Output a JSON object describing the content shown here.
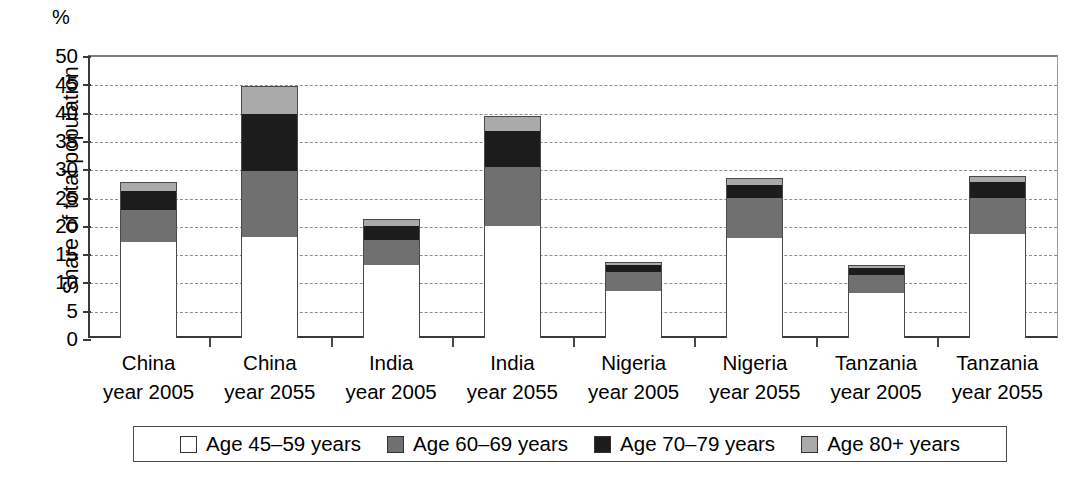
{
  "chart_data": {
    "type": "bar",
    "stacked": true,
    "title": "",
    "xlabel": "",
    "ylabel": "Share of total population",
    "yunit": "%",
    "ylim": [
      0,
      50
    ],
    "ytick_step": 5,
    "yticks": [
      "50",
      "45",
      "40",
      "35",
      "30",
      "25",
      "20",
      "15",
      "10",
      "5",
      "0"
    ],
    "grid": true,
    "legend_position": "bottom",
    "categories": [
      "China year 2005",
      "China year 2055",
      "India year 2005",
      "India year 2055",
      "Nigeria year 2005",
      "Nigeria year 2055",
      "Tanzania year 2005",
      "Tanzania year 2055"
    ],
    "category_lines": [
      {
        "l1": "China",
        "l2": "year 2005"
      },
      {
        "l1": "China",
        "l2": "year 2055"
      },
      {
        "l1": "India",
        "l2": "year 2005"
      },
      {
        "l1": "India",
        "l2": "year 2055"
      },
      {
        "l1": "Nigeria",
        "l2": "year 2005"
      },
      {
        "l1": "Nigeria",
        "l2": "year 2055"
      },
      {
        "l1": "Tanzania",
        "l2": "year 2005"
      },
      {
        "l1": "Tanzania",
        "l2": "year 2055"
      }
    ],
    "series": [
      {
        "name": "Age 45–59 years",
        "color": "#ffffff",
        "values": [
          17.0,
          18.0,
          13.0,
          19.9,
          8.5,
          17.7,
          8.1,
          18.4
        ]
      },
      {
        "name": "Age 60–69 years",
        "color": "#707070",
        "values": [
          5.8,
          11.7,
          4.4,
          10.4,
          3.4,
          7.2,
          3.2,
          6.5
        ]
      },
      {
        "name": "Age 70–79 years",
        "color": "#1c1c1c",
        "values": [
          3.4,
          10.0,
          2.6,
          6.5,
          1.2,
          2.3,
          1.2,
          2.8
        ]
      },
      {
        "name": "Age 80+ years",
        "color": "#aaaaaa",
        "values": [
          1.4,
          4.8,
          1.0,
          2.5,
          0.4,
          1.1,
          0.4,
          1.0
        ]
      }
    ],
    "totals": [
      27.6,
      44.5,
      21.0,
      39.3,
      13.5,
      28.3,
      12.9,
      28.7
    ]
  },
  "legend": {
    "items": [
      {
        "label": "Age 45–59 years",
        "swatch": "white-swatch"
      },
      {
        "label": "Age 60–69 years",
        "swatch": "gray-swatch"
      },
      {
        "label": "Age 70–79 years",
        "swatch": "black-swatch"
      },
      {
        "label": "Age 80+ years",
        "swatch": "light-gray-swatch"
      }
    ]
  }
}
